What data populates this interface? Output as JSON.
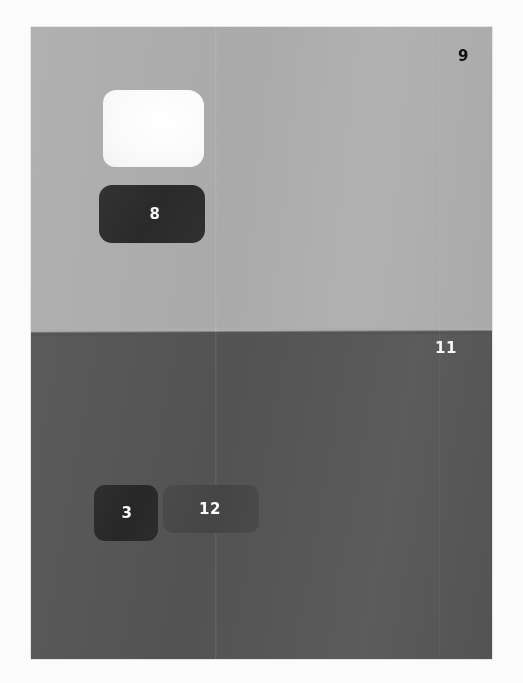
{
  "artwork": {
    "title": "Two-field composition with numbered patches",
    "medium_appearance": "painted / printed plate on white page",
    "plate": {
      "background_upper_color": "#adadad",
      "background_lower_color": "#555555"
    },
    "fields": [
      {
        "name": "upper-field",
        "color": "#adadad",
        "description": "light gray color field occupying the top half"
      },
      {
        "name": "lower-field",
        "color": "#555555",
        "description": "dark gray color field occupying the bottom half"
      }
    ],
    "patches": [
      {
        "name": "white-patch",
        "label": "",
        "color": "#fafafa",
        "label_color": "",
        "field": "upper-field"
      },
      {
        "name": "patch-eight",
        "label": "8",
        "color": "#2d2d2d",
        "label_color": "#f6f6f6",
        "field": "upper-field"
      },
      {
        "name": "patch-three",
        "label": "3",
        "color": "#2a2a2a",
        "label_color": "#fafafa",
        "field": "lower-field"
      },
      {
        "name": "patch-twelve",
        "label": "12",
        "color": "#484848",
        "label_color": "#fbfbfb",
        "field": "lower-field"
      }
    ],
    "free_labels": [
      {
        "name": "label-nine",
        "label": "9",
        "color": "#101010",
        "field": "upper-field",
        "position": "top-right"
      },
      {
        "name": "label-eleven",
        "label": "11",
        "color": "#f7f7f7",
        "field": "lower-field",
        "position": "upper-right of lower field"
      }
    ]
  }
}
